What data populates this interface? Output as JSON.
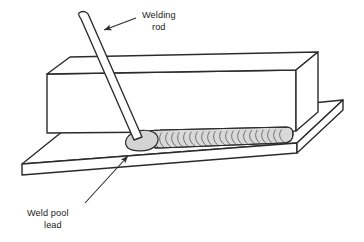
{
  "figure": {
    "background_color": "#ffffff",
    "line_color": "#2b2b2b",
    "fill_color": "#ffffff",
    "bead_fill_color": "#d9d9d9",
    "pool_fill_color": "#d4d4d4",
    "rod_fill_color": "#ffffff"
  },
  "labels": {
    "welding_rod": {
      "line1": "Welding",
      "line2": "rod"
    },
    "weld_pool": {
      "line1": "Weld pool",
      "line2": "lead"
    }
  },
  "parts": {
    "base_plate_name": "base-plate",
    "upper_block_name": "upper-block",
    "welding_rod_name": "welding-rod",
    "weld_bead_name": "weld-bead",
    "weld_pool_name": "weld-pool"
  },
  "leaders": {
    "welding_rod_arrow": "arrowhead pointing down-left to rod",
    "weld_pool_arrow": "arrowhead pointing up-right to pool"
  }
}
